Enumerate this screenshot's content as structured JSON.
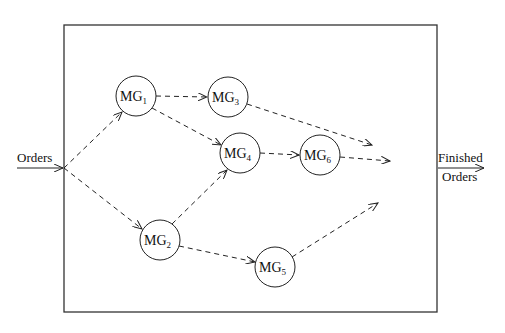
{
  "diagram": {
    "type": "flow-network",
    "frame": {
      "x": 64,
      "y": 25,
      "width": 373,
      "height": 287
    },
    "input": {
      "label": "Orders",
      "from": [
        17,
        168
      ],
      "to": [
        64,
        168
      ]
    },
    "output": {
      "label_top": "Finished",
      "label_bottom": "Orders",
      "from": [
        437,
        168
      ],
      "to": [
        484,
        168
      ]
    },
    "nodes": [
      {
        "id": "MG1",
        "base": "MG",
        "sub": "1",
        "cx": 136,
        "cy": 96,
        "r": 20
      },
      {
        "id": "MG2",
        "base": "MG",
        "sub": "2",
        "cx": 160,
        "cy": 240,
        "r": 20
      },
      {
        "id": "MG3",
        "base": "MG",
        "sub": "3",
        "cx": 228,
        "cy": 97,
        "r": 20
      },
      {
        "id": "MG4",
        "base": "MG",
        "sub": "4",
        "cx": 240,
        "cy": 153,
        "r": 20
      },
      {
        "id": "MG5",
        "base": "MG",
        "sub": "5",
        "cx": 275,
        "cy": 267,
        "r": 20
      },
      {
        "id": "MG6",
        "base": "MG",
        "sub": "6",
        "cx": 320,
        "cy": 155,
        "r": 20
      }
    ],
    "edges": [
      {
        "from": "input",
        "to": "MG1",
        "style": "dashed"
      },
      {
        "from": "input",
        "to": "MG2",
        "style": "dashed"
      },
      {
        "from": "MG1",
        "to": "MG3",
        "style": "dashed"
      },
      {
        "from": "MG1",
        "to": "MG4",
        "style": "dashed"
      },
      {
        "from": "MG2",
        "to": "MG4",
        "style": "dashed"
      },
      {
        "from": "MG2",
        "to": "MG5",
        "style": "dashed"
      },
      {
        "from": "MG4",
        "to": "MG6",
        "style": "dashed"
      },
      {
        "from": "MG3",
        "to": "output",
        "style": "dashed"
      },
      {
        "from": "MG6",
        "to": "output",
        "style": "dashed"
      },
      {
        "from": "MG5",
        "to": "output",
        "style": "dashed"
      }
    ],
    "colors": {
      "stroke": "#222222",
      "background": "#ffffff"
    }
  }
}
